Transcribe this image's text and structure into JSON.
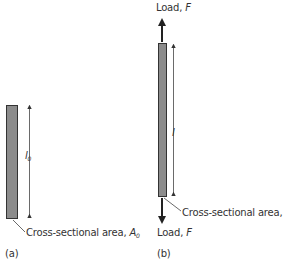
{
  "diagram": {
    "type": "tensile-specimen-elongation",
    "colors": {
      "bar_fill": "#8c8c8c",
      "bar_stroke": "#333333",
      "line": "#333333"
    },
    "panel_a": {
      "caption": "(a)",
      "length_label": "l",
      "length_subscript": "0",
      "area_label_prefix": "Cross-sectional area, ",
      "area_symbol": "A",
      "area_subscript": "0"
    },
    "panel_b": {
      "caption": "(b)",
      "length_label": "l",
      "area_label_prefix": "Cross-sectional area, ",
      "area_symbol": "A",
      "top_load_prefix": "Load, ",
      "top_load_symbol": "F",
      "bottom_load_prefix": "Load, ",
      "bottom_load_symbol": "F"
    }
  }
}
